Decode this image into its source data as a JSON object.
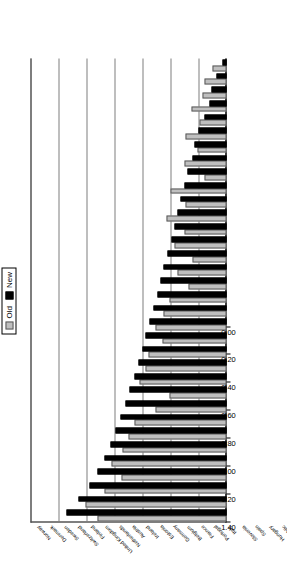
{
  "chart_data": {
    "type": "bar",
    "orientation": "horizontal",
    "title": "",
    "subtitle": "",
    "xlabel": "",
    "ylabel": "",
    "xlim": [
      0.0,
      1.4
    ],
    "grid": true,
    "legend_position": "top-right",
    "xticks": [
      "0.00",
      "0.20",
      "0.40",
      "0.60",
      "0.80",
      "1.00",
      "1.20",
      "1.40"
    ],
    "xtick_values": [
      0.0,
      0.2,
      0.4,
      0.6,
      0.8,
      1.0,
      1.2,
      1.4
    ],
    "categories": [
      "Moldova",
      "Albania",
      "Ukraine",
      "Bosnia and Herzegovina",
      "Macedonia, FYR",
      "Turkey",
      "Romania",
      "Bulgaria",
      "Russian Federation",
      "Serbia",
      "Poland",
      "Croatia",
      "Latvia",
      "Czech Republic",
      "Lithuania",
      "Slovak Republic",
      "Hungary",
      "Spain",
      "Slovenia",
      "Italy",
      "Portugal",
      "France",
      "Belgium",
      "Germany",
      "Estonia",
      "Ireland",
      "Austria",
      "Netherlands",
      "United Kingdom",
      "Finland",
      "Switzerland",
      "Sweden",
      "Denmark",
      "Norway"
    ],
    "series": [
      {
        "name": "Old",
        "color": "#bfbfbf",
        "values": [
          0.1,
          0.16,
          0.17,
          0.25,
          0.19,
          0.29,
          0.21,
          0.3,
          0.16,
          0.4,
          0.29,
          0.43,
          0.3,
          0.37,
          0.24,
          0.35,
          0.27,
          0.41,
          0.45,
          0.51,
          0.46,
          0.56,
          0.58,
          0.62,
          0.41,
          0.51,
          0.66,
          0.7,
          0.74,
          0.82,
          0.75,
          0.87,
          1.01,
          0.92
        ]
      },
      {
        "name": "New",
        "color": "#000000",
        "values": [
          0.03,
          0.07,
          0.11,
          0.12,
          0.16,
          0.2,
          0.23,
          0.24,
          0.28,
          0.3,
          0.33,
          0.35,
          0.37,
          0.39,
          0.42,
          0.45,
          0.47,
          0.49,
          0.52,
          0.55,
          0.58,
          0.6,
          0.63,
          0.66,
          0.69,
          0.72,
          0.76,
          0.79,
          0.83,
          0.87,
          0.92,
          0.98,
          1.06,
          1.14
        ]
      }
    ]
  },
  "legend": {
    "items": [
      {
        "label": "Old",
        "color": "#bfbfbf"
      },
      {
        "label": "New",
        "color": "#000000"
      }
    ]
  }
}
